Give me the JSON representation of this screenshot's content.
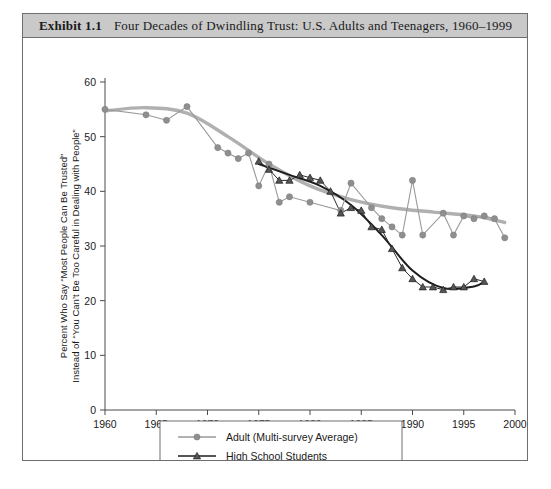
{
  "exhibit": {
    "number": "Exhibit 1.1",
    "title": "Four Decades of Dwindling Trust: U.S. Adults and Teenagers, 1960–1999"
  },
  "chart_data": {
    "type": "line",
    "title": "Four Decades of Dwindling Trust: U.S. Adults and Teenagers, 1960–1999",
    "xlabel": "",
    "ylabel_line1": "Percent Who Say “Most People Can Be Trusted”",
    "ylabel_line2": "Instead of “You Can’t Be Too Careful in Dealing with People”",
    "xlim": [
      1960,
      2000
    ],
    "ylim": [
      0,
      60
    ],
    "xticks": [
      1960,
      1965,
      1970,
      1975,
      1980,
      1985,
      1990,
      1995,
      2000
    ],
    "yticks": [
      0,
      10,
      20,
      30,
      40,
      50,
      60
    ],
    "xtick_labels": [
      "1960",
      "1965",
      "1970",
      "1975",
      "1980",
      "1985",
      "1990",
      "1995",
      "2000"
    ],
    "ytick_labels": [
      "0",
      "10",
      "20",
      "30",
      "40",
      "50",
      "60"
    ],
    "grid": false,
    "legend_position": "bottom-center",
    "series": [
      {
        "name": "Adult (Multi-survey Average)",
        "color": "#9a9a9a",
        "marker": "circle",
        "x": [
          1960,
          1964,
          1966,
          1968,
          1971,
          1972,
          1973,
          1974,
          1975,
          1976,
          1977,
          1978,
          1980,
          1983,
          1984,
          1986,
          1987,
          1988,
          1989,
          1990,
          1991,
          1993,
          1994,
          1995,
          1996,
          1997,
          1998,
          1999
        ],
        "values": [
          55.0,
          54.0,
          53.0,
          55.5,
          48.0,
          47.0,
          46.0,
          47.0,
          41.0,
          45.0,
          38.0,
          39.0,
          38.0,
          36.5,
          41.5,
          37.0,
          35.0,
          33.5,
          32.0,
          42.0,
          32.0,
          36.0,
          32.0,
          35.5,
          35.0,
          35.5,
          35.0,
          31.5
        ],
        "trend_x": [
          1960,
          1964,
          1968,
          1972,
          1976,
          1980,
          1984,
          1988,
          1992,
          1996,
          1999
        ],
        "trend_values": [
          54.7,
          55.3,
          54.3,
          50.0,
          45.0,
          41.0,
          38.5,
          37.0,
          36.2,
          35.5,
          34.3
        ]
      },
      {
        "name": "High School Students",
        "color": "#1d1d1d",
        "marker": "triangle",
        "x": [
          1975,
          1976,
          1977,
          1978,
          1979,
          1980,
          1981,
          1982,
          1983,
          1984,
          1985,
          1986,
          1987,
          1988,
          1989,
          1990,
          1991,
          1992,
          1993,
          1994,
          1995,
          1996,
          1997
        ],
        "values": [
          45.5,
          44.0,
          42.0,
          42.0,
          43.0,
          42.5,
          42.0,
          40.0,
          36.0,
          37.0,
          36.5,
          33.5,
          33.0,
          29.5,
          26.0,
          24.0,
          22.5,
          22.5,
          22.0,
          22.5,
          22.5,
          24.0,
          23.5
        ],
        "trend_x": [
          1975,
          1978,
          1981,
          1984,
          1987,
          1990,
          1993,
          1996,
          1997
        ],
        "trend_values": [
          45.0,
          43.0,
          41.0,
          37.5,
          32.0,
          25.5,
          22.3,
          22.6,
          23.5
        ]
      }
    ]
  },
  "legend": {
    "items": [
      {
        "label": "Adult (Multi-survey Average)",
        "marker": "circle",
        "color": "#9a9a9a"
      },
      {
        "label": "High School Students",
        "marker": "triangle",
        "color": "#1d1d1d"
      }
    ]
  }
}
